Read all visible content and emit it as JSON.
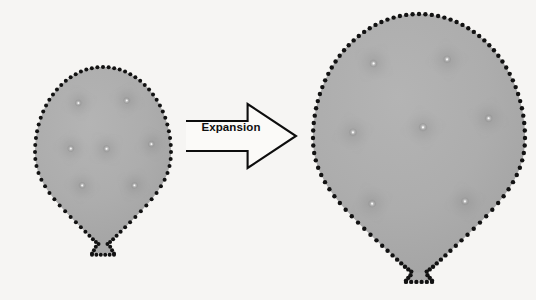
{
  "figure": {
    "background_color": "#f6f5f3",
    "balloon_fill_color": "#ababab",
    "balloon_outline_color": "#121212",
    "swirl_color": "#6f6f6f",
    "arrow_color": "#0d0d0d",
    "label_color": "#101010"
  },
  "arrow": {
    "label": "Expansion",
    "icon": "block-arrow-right-icon",
    "direction": "right",
    "x": 186,
    "y": 104,
    "width": 110,
    "height": 64
  },
  "balloons": [
    {
      "id": "balloon-small",
      "name": "small-balloon",
      "state": "before",
      "center_x": 103,
      "center_y": 152,
      "radius_x": 68,
      "radius_y": 85,
      "dot_count": 76,
      "dot_radius": 2.0,
      "knot": {
        "x": 103,
        "y": 240,
        "width": 22,
        "height": 26
      },
      "particles": [
        {
          "id": "s1",
          "x": 79,
          "y": 103,
          "size": 13
        },
        {
          "id": "s2",
          "x": 127,
          "y": 100,
          "size": 13
        },
        {
          "id": "s3",
          "x": 71,
          "y": 148,
          "size": 13
        },
        {
          "id": "s4",
          "x": 106,
          "y": 149,
          "size": 14
        },
        {
          "id": "s5",
          "x": 152,
          "y": 144,
          "size": 13
        },
        {
          "id": "s6",
          "x": 82,
          "y": 186,
          "size": 13
        },
        {
          "id": "s7",
          "x": 134,
          "y": 185,
          "size": 13
        }
      ]
    },
    {
      "id": "balloon-large",
      "name": "large-balloon",
      "state": "after",
      "center_x": 419,
      "center_y": 138,
      "radius_x": 106,
      "radius_y": 124,
      "dot_count": 104,
      "dot_radius": 2.2,
      "knot": {
        "x": 419,
        "y": 265,
        "width": 26,
        "height": 30
      },
      "particles": [
        {
          "id": "l1",
          "x": 374,
          "y": 63,
          "size": 15
        },
        {
          "id": "l2",
          "x": 447,
          "y": 60,
          "size": 15
        },
        {
          "id": "l3",
          "x": 353,
          "y": 133,
          "size": 15
        },
        {
          "id": "l4",
          "x": 423,
          "y": 128,
          "size": 16
        },
        {
          "id": "l5",
          "x": 488,
          "y": 118,
          "size": 15
        },
        {
          "id": "l6",
          "x": 372,
          "y": 203,
          "size": 15
        },
        {
          "id": "l7",
          "x": 465,
          "y": 202,
          "size": 15
        }
      ]
    }
  ]
}
